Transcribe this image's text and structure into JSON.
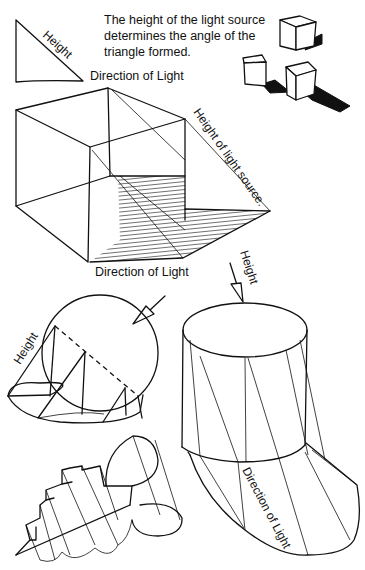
{
  "caption": {
    "line1": "The height of the light source",
    "line2": "determines the angle of the",
    "line3": "triangle formed."
  },
  "triangle_diagram": {
    "height_label": "Height",
    "direction_label": "Direction of Light"
  },
  "box_diagram": {
    "height_label": "Height of light source.",
    "direction_label": "Direction of Light"
  },
  "sphere_diagram": {
    "height_label": "Height"
  },
  "cylinder_diagram": {
    "height_label": "Height",
    "direction_label": "Direction of Light"
  },
  "colors": {
    "ink": "#111111",
    "paper": "#ffffff"
  }
}
